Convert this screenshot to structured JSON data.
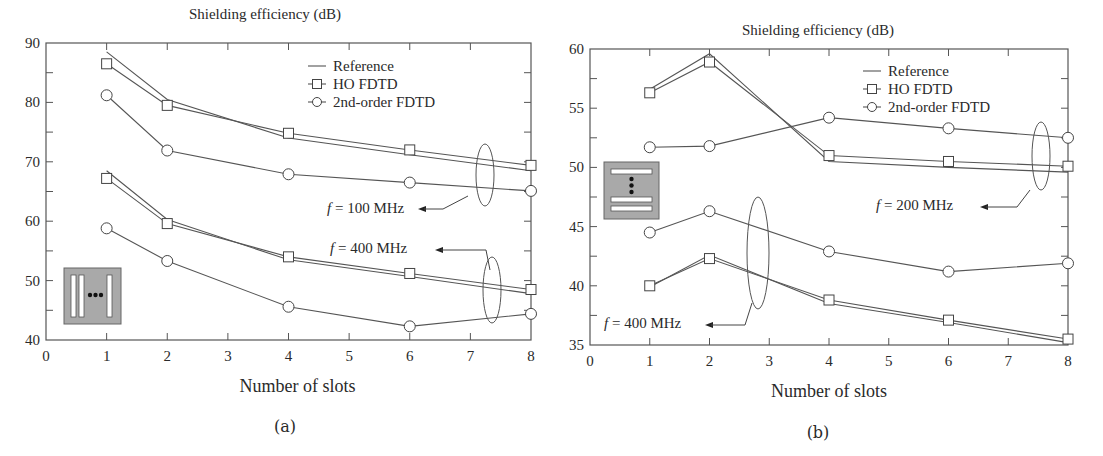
{
  "page_header_fragment": "",
  "chart_data": [
    {
      "id": "a",
      "type": "line",
      "caption": "(a)",
      "title": "Shielding efficiency (dB)",
      "xlabel": "Number of slots",
      "ylabel": "Shielding efficiency (dB)",
      "xlim": [
        0,
        8
      ],
      "ylim": [
        40,
        90
      ],
      "xticks": [
        "0",
        "1",
        "2",
        "3",
        "4",
        "5",
        "6",
        "7",
        "8"
      ],
      "yticks": [
        "40",
        "50",
        "60",
        "70",
        "80",
        "90"
      ],
      "grid": false,
      "legend": {
        "position": "upper right",
        "entries": [
          "Reference",
          "HO FDTD",
          "2nd-order FDTD"
        ]
      },
      "x": [
        1,
        2,
        4,
        6,
        8
      ],
      "series": [
        {
          "name": "Reference",
          "group": "f = 100 MHz",
          "values": [
            88.5,
            80.5,
            74.0,
            71.2,
            68.5
          ]
        },
        {
          "name": "HO FDTD",
          "group": "f = 100 MHz",
          "values": [
            86.5,
            79.5,
            74.8,
            72.0,
            69.4
          ]
        },
        {
          "name": "2nd-order FDTD",
          "group": "f = 100 MHz",
          "values": [
            81.2,
            71.9,
            67.9,
            66.5,
            65.1
          ]
        },
        {
          "name": "Reference",
          "group": "f = 400 MHz",
          "values": [
            68.5,
            60.3,
            53.5,
            50.7,
            47.8
          ]
        },
        {
          "name": "HO FDTD",
          "group": "f = 400 MHz",
          "values": [
            67.2,
            59.6,
            54.0,
            51.2,
            48.5
          ]
        },
        {
          "name": "2nd-order FDTD",
          "group": "f = 400 MHz",
          "values": [
            58.8,
            53.3,
            45.6,
            42.3,
            44.4
          ]
        }
      ],
      "annotations": [
        {
          "text_italic": "f",
          "text": " = 100 MHz"
        },
        {
          "text_italic": "f",
          "text": " = 400 MHz"
        }
      ],
      "inset": "vertical slots"
    },
    {
      "id": "b",
      "type": "line",
      "caption": "(b)",
      "title": "Shielding efficiency (dB)",
      "xlabel": "Number of slots",
      "ylabel": "Shielding efficiency (dB)",
      "xlim": [
        0,
        8
      ],
      "ylim": [
        35,
        60
      ],
      "xticks": [
        "0",
        "1",
        "2",
        "3",
        "4",
        "5",
        "6",
        "7",
        "8"
      ],
      "yticks": [
        "35",
        "40",
        "45",
        "50",
        "55",
        "60"
      ],
      "grid": false,
      "legend": {
        "position": "upper right",
        "entries": [
          "Reference",
          "HO FDTD",
          "2nd-order FDTD"
        ]
      },
      "x": [
        1,
        2,
        4,
        6,
        8
      ],
      "series": [
        {
          "name": "Reference",
          "group": "f = 200 MHz",
          "values": [
            56.6,
            59.6,
            50.5,
            50.0,
            49.6
          ]
        },
        {
          "name": "HO FDTD",
          "group": "f = 200 MHz",
          "values": [
            56.3,
            58.9,
            51.0,
            50.5,
            50.1
          ]
        },
        {
          "name": "2nd-order FDTD",
          "group": "f = 200 MHz",
          "values": [
            51.7,
            51.8,
            54.2,
            53.3,
            52.5
          ]
        },
        {
          "name": "Reference",
          "group": "f = 400 MHz",
          "values": [
            39.9,
            42.6,
            38.5,
            36.9,
            35.2
          ]
        },
        {
          "name": "HO FDTD",
          "group": "f = 400 MHz",
          "values": [
            40.0,
            42.3,
            38.8,
            37.1,
            35.5
          ]
        },
        {
          "name": "2nd-order FDTD",
          "group": "f = 400 MHz",
          "values": [
            44.5,
            46.3,
            42.9,
            41.2,
            41.9
          ]
        }
      ],
      "annotations": [
        {
          "text_italic": "f",
          "text": " = 200 MHz"
        },
        {
          "text_italic": "f",
          "text": " = 400 MHz"
        }
      ],
      "inset": "horizontal slots"
    }
  ]
}
